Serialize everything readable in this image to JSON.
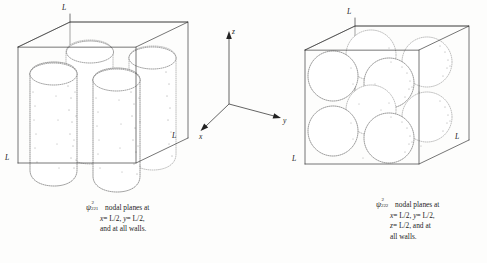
{
  "figure": {
    "kind": "scientific-illustration",
    "background_color": "#fdfdfc",
    "ink_color": "#2b2b2b"
  },
  "axes": {
    "z_label": "z",
    "y_label": "y",
    "x_label": "x"
  },
  "panels": [
    {
      "id": "left",
      "edge_labels": [
        "L",
        "L",
        "L"
      ],
      "lobe_count": 4,
      "lobe_shape": "vertical-pillar",
      "arrangement": "2 x 2 x 1",
      "caption": {
        "symbol_base": "ψ",
        "symbol_superscript": "2",
        "symbol_subscript": "221",
        "line1": "nodal planes at",
        "line2_x": "x",
        "line2_x_val": "= L/2,",
        "line2_y": "y",
        "line2_y_val": "= L/2,",
        "line3": "and at all walls."
      }
    },
    {
      "id": "right",
      "edge_labels": [
        "L",
        "L",
        "L"
      ],
      "lobe_count": 8,
      "lobe_shape": "sphere",
      "arrangement": "2 x 2 x 2",
      "caption": {
        "symbol_base": "ψ",
        "symbol_superscript": "2",
        "symbol_subscript": "222",
        "line1": "nodal planes at",
        "line2_x": "x",
        "line2_x_val": "= L/2,",
        "line2_y": "y",
        "line2_y_val": "= L/2,",
        "line3_z": "z",
        "line3_z_val": "= L/2, and at",
        "line4": "all walls."
      }
    }
  ]
}
